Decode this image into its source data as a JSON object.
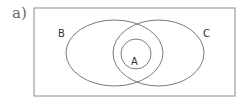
{
  "figure": {
    "label": "a)"
  },
  "colors": {
    "stroke": "#7a7a7a",
    "border": "#8a8a8a",
    "text": "#333333",
    "background": "#ffffff"
  },
  "diagram": {
    "type": "venn",
    "universe": {
      "x": 34,
      "y": 8,
      "width": 201,
      "height": 88
    },
    "sets": [
      {
        "name": "B",
        "label": "B",
        "shape": "ellipse",
        "cx": 114.5,
        "cy": 53,
        "rx": 48.5,
        "ry": 33,
        "label_x": 58,
        "label_y": 37
      },
      {
        "name": "C",
        "label": "C",
        "shape": "ellipse",
        "cx": 158.5,
        "cy": 53,
        "rx": 45.5,
        "ry": 33,
        "label_x": 203,
        "label_y": 37
      },
      {
        "name": "A",
        "label": "A",
        "shape": "circle",
        "cx": 136,
        "cy": 54,
        "r": 15,
        "label_x": 131,
        "label_y": 65
      }
    ],
    "relations": "A ⊂ B ∩ C"
  }
}
